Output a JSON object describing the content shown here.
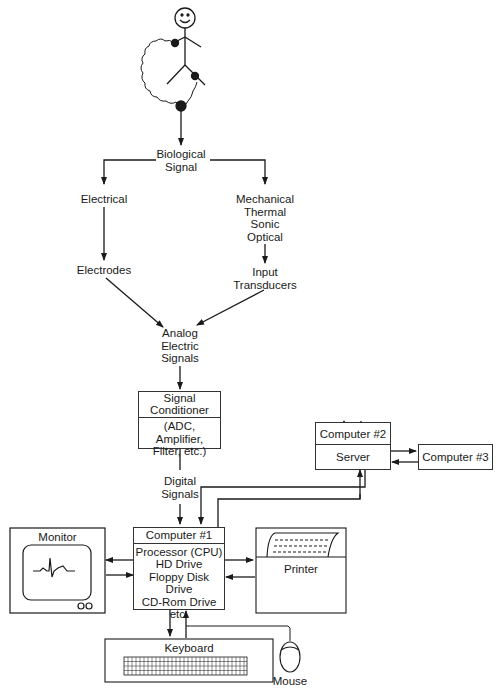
{
  "diagram": {
    "type": "block-diagram",
    "nodes": {
      "biological_signal": "Biological\nSignal",
      "electrical": "Electrical",
      "mechanical": "Mechanical\nThermal\nSonic\nOptical",
      "electrodes": "Electrodes",
      "input_transducers": "Input\nTransducers",
      "analog_signals": "Analog\nElectric\nSignals",
      "signal_conditioner_title": "Signal\nConditioner",
      "signal_conditioner_detail": "(ADC, Amplifier,\nFilter, etc.)",
      "digital_signals": "Digital\nSignals",
      "computer1_title": "Computer #1",
      "computer1_detail": "Processor (CPU)\nHD Drive\nFloppy Disk Drive\nCD-Rom Drive\netc.",
      "computer2": "Computer #2",
      "computer3": "Computer #3",
      "server": "Server",
      "monitor": "Monitor",
      "printer": "Printer",
      "keyboard": "Keyboard",
      "mouse": "Mouse"
    },
    "edges": [
      [
        "subject",
        "biological_signal"
      ],
      [
        "biological_signal",
        "electrical"
      ],
      [
        "biological_signal",
        "mechanical"
      ],
      [
        "electrical",
        "electrodes"
      ],
      [
        "mechanical",
        "input_transducers"
      ],
      [
        "electrodes",
        "analog_signals"
      ],
      [
        "input_transducers",
        "analog_signals"
      ],
      [
        "analog_signals",
        "signal_conditioner"
      ],
      [
        "signal_conditioner",
        "digital_signals"
      ],
      [
        "digital_signals",
        "computer1"
      ],
      [
        "computer1",
        "monitor"
      ],
      [
        "monitor",
        "computer1"
      ],
      [
        "computer1",
        "printer"
      ],
      [
        "printer",
        "computer1"
      ],
      [
        "computer1",
        "keyboard"
      ],
      [
        "keyboard",
        "computer1"
      ],
      [
        "mouse",
        "computer1"
      ],
      [
        "computer1",
        "server"
      ],
      [
        "server",
        "computer1"
      ],
      [
        "server",
        "computer2"
      ],
      [
        "computer2",
        "server"
      ],
      [
        "server",
        "computer3"
      ],
      [
        "computer3",
        "server"
      ]
    ]
  }
}
